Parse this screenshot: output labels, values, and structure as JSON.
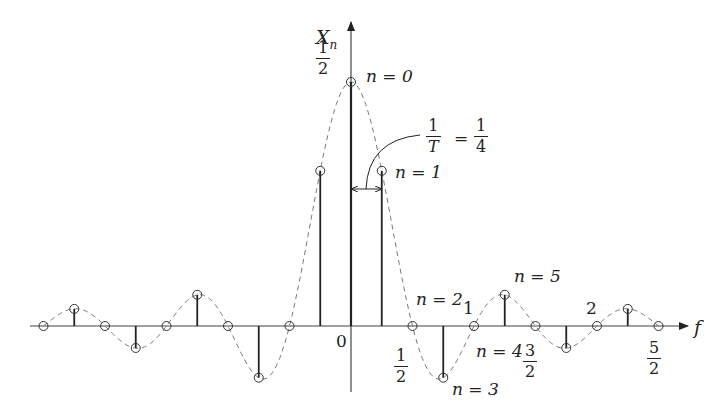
{
  "axes": {
    "y_label": "X",
    "y_label_sub": "n",
    "x_label": "f",
    "origin_label": "0"
  },
  "peak_label": {
    "num": "1",
    "den": "2"
  },
  "spacing_annotation": {
    "lhs_num": "1",
    "lhs_den": "T",
    "eq": "=",
    "rhs_num": "1",
    "rhs_den": "4"
  },
  "x_ticks": [
    {
      "type": "frac",
      "num": "1",
      "den": "2",
      "value": 0.5
    },
    {
      "type": "int",
      "text": "1",
      "value": 1.0
    },
    {
      "type": "frac",
      "num": "3",
      "den": "2",
      "value": 1.5
    },
    {
      "type": "int",
      "text": "2",
      "value": 2.0
    },
    {
      "type": "frac",
      "num": "5",
      "den": "2",
      "value": 2.5
    }
  ],
  "n_labels": {
    "n0": "n = 0",
    "n1": "n = 1",
    "n2": "n = 2",
    "n3": "n = 3",
    "n4": "n = 4",
    "n5": "n = 5"
  },
  "chart_data": {
    "type": "stem",
    "title": "",
    "xlabel": "f",
    "ylabel": "X_n",
    "spacing": 0.25,
    "envelope": "dashed sinc: X(f) = sin(2πf)/(4πf)·... (zeros at multiples of 1/2)",
    "n": [
      -10,
      -9,
      -8,
      -7,
      -6,
      -5,
      -4,
      -3,
      -2,
      -1,
      0,
      1,
      2,
      3,
      4,
      5,
      6,
      7,
      8,
      9,
      10
    ],
    "f": [
      -2.5,
      -2.25,
      -2.0,
      -1.75,
      -1.5,
      -1.25,
      -1.0,
      -0.75,
      -0.5,
      -0.25,
      0,
      0.25,
      0.5,
      0.75,
      1.0,
      1.25,
      1.5,
      1.75,
      2.0,
      2.25,
      2.5
    ],
    "values": [
      0,
      0.035,
      0,
      -0.045,
      0,
      0.064,
      0,
      -0.106,
      0,
      0.318,
      0.5,
      0.318,
      0,
      -0.106,
      0,
      0.064,
      0,
      -0.045,
      0,
      0.035,
      0
    ],
    "xlim": [
      -2.8,
      2.8
    ],
    "ylim": [
      -0.15,
      0.6
    ],
    "grid": false
  }
}
